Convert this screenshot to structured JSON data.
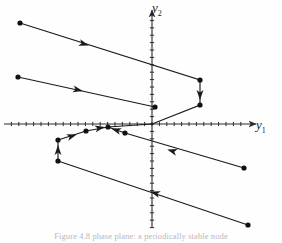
{
  "figure": {
    "title": "",
    "caption": "Figure 4.8  phase plane: a periodically stable node",
    "axis_labels": {
      "x": "y",
      "x_sub": "1",
      "y": "y",
      "y_sub": "2"
    }
  },
  "chart_data": {
    "type": "scatter",
    "title": "",
    "xlabel": "y1",
    "ylabel": "y2",
    "grid": false,
    "legend": null,
    "axes": {
      "origin_px": [
        152,
        124
      ],
      "x_axis_px": {
        "x0": 4,
        "x1": 256,
        "y": 124
      },
      "y_axis_px": {
        "x": 152,
        "y0": 10,
        "y1": 228
      },
      "x_tick_spacing_px": 7.4,
      "y_tick_spacing_px": 7.4,
      "arrowheads": [
        "x-positive",
        "y-positive"
      ],
      "tick_count_x": 34,
      "tick_count_y": 29
    },
    "trajectories": [
      {
        "name": "orbit-1",
        "points_px": [
          [
            20,
            23
          ],
          [
            200,
            80
          ],
          [
            200,
            105
          ],
          [
            152,
            124
          ]
        ],
        "arrows_px": [
          {
            "x": 84,
            "y": 44,
            "angle": 17
          },
          {
            "x": 200,
            "y": 95,
            "angle": 90
          }
        ]
      },
      {
        "name": "orbit-2",
        "points_px": [
          [
            18,
            77
          ],
          [
            155,
            107
          ]
        ],
        "arrows_px": [
          {
            "x": 78,
            "y": 90,
            "angle": 13
          }
        ]
      },
      {
        "name": "orbit-3",
        "points_px": [
          [
            58,
            140
          ],
          [
            86,
            131
          ],
          [
            108,
            127
          ],
          [
            152,
            124
          ]
        ],
        "arrows_px": [
          {
            "x": 72,
            "y": 136,
            "angle": -18
          },
          {
            "x": 100,
            "y": 128,
            "angle": -11
          }
        ]
      },
      {
        "name": "orbit-4",
        "points_px": [
          [
            58,
            161
          ],
          [
            58,
            140
          ]
        ],
        "arrows_px": [
          {
            "x": 58,
            "y": 150,
            "angle": -90
          }
        ]
      },
      {
        "name": "orbit-5",
        "points_px": [
          [
            244,
            168
          ],
          [
            125,
            133
          ],
          [
            108,
            127
          ]
        ],
        "arrows_px": [
          {
            "x": 172,
            "y": 151,
            "angle": 196
          },
          {
            "x": 116,
            "y": 130,
            "angle": 198
          }
        ]
      },
      {
        "name": "orbit-6",
        "points_px": [
          [
            248,
            225
          ],
          [
            58,
            161
          ]
        ],
        "arrows_px": [
          {
            "x": 155,
            "y": 193,
            "angle": 198
          }
        ]
      }
    ],
    "points_px": [
      [
        20,
        23
      ],
      [
        200,
        80
      ],
      [
        200,
        105
      ],
      [
        18,
        77
      ],
      [
        155,
        107
      ],
      [
        58,
        140
      ],
      [
        86,
        131
      ],
      [
        108,
        127
      ],
      [
        58,
        161
      ],
      [
        244,
        168
      ],
      [
        125,
        133
      ],
      [
        248,
        225
      ]
    ],
    "point_marker": "filled-circle",
    "point_color": "#111111",
    "line_color": "#1a1a1a",
    "axis_color": "#2b2b33"
  },
  "colors": {
    "background": "#ffffff",
    "axis": "#2b2b33",
    "curve": "#1a1a1a",
    "marker": "#111111",
    "caption": "#7d7d86"
  }
}
